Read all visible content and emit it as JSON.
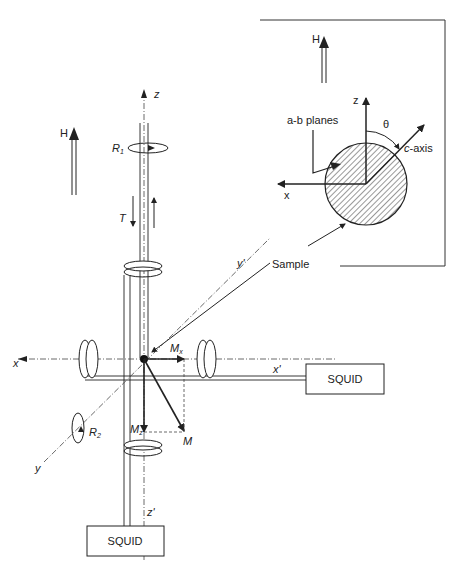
{
  "figure": {
    "inset": {
      "field_label": "H",
      "z_label": "z",
      "x_label": "x",
      "planes_label": "a-b planes",
      "angle_label": "θ",
      "c_axis_label": "c-axis",
      "sample_label": "Sample"
    },
    "main": {
      "field_label": "H",
      "z_label": "z",
      "z_prime_label": "z'",
      "x_label": "x",
      "x_prime_label": "x'",
      "y_label": "y",
      "y_prime_label": "y'",
      "rotation1_label": "R",
      "rotation1_sub": "1",
      "rotation2_label": "R",
      "rotation2_sub": "2",
      "torque_label": "T",
      "mx_label": "M",
      "mx_sub": "x",
      "mz_label": "M",
      "mz_sub": "z",
      "m_label": "M",
      "squid_right_label": "SQUID",
      "squid_bottom_label": "SQUID"
    },
    "colors": {
      "line": "#222222",
      "hatch": "#333333",
      "background": "#ffffff"
    }
  }
}
